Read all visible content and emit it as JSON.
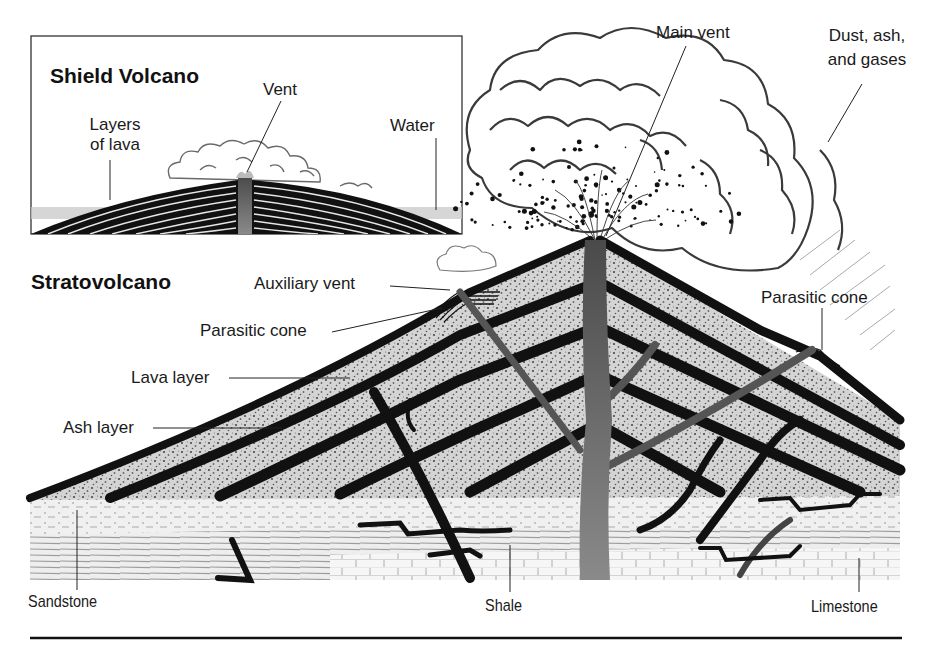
{
  "figure": {
    "palette": {
      "ink": "#111111",
      "lava": "#141414",
      "ash_fill": "#c9c9c9",
      "ash_speckle": "#555555",
      "vent": "#5a5a5a",
      "water": "#bdbdbd",
      "ground": "#eeeeee",
      "cloud_stroke": "#444444"
    }
  },
  "shield": {
    "title": "Shield Volcano",
    "labels": {
      "vent": "Vent",
      "layers_line1": "Layers",
      "layers_line2": "of lava",
      "water": "Water"
    }
  },
  "strato": {
    "title": "Stratovolcano",
    "labels": {
      "main_vent": "Main vent",
      "dust_line1": "Dust, ash,",
      "dust_line2": "and gases",
      "auxiliary_vent": "Auxiliary vent",
      "parasitic_cone_left": "Parasitic cone",
      "parasitic_cone_right": "Parasitic cone",
      "lava_layer": "Lava layer",
      "ash_layer": "Ash layer",
      "sandstone": "Sandstone",
      "shale": "Shale",
      "limestone": "Limestone"
    }
  }
}
